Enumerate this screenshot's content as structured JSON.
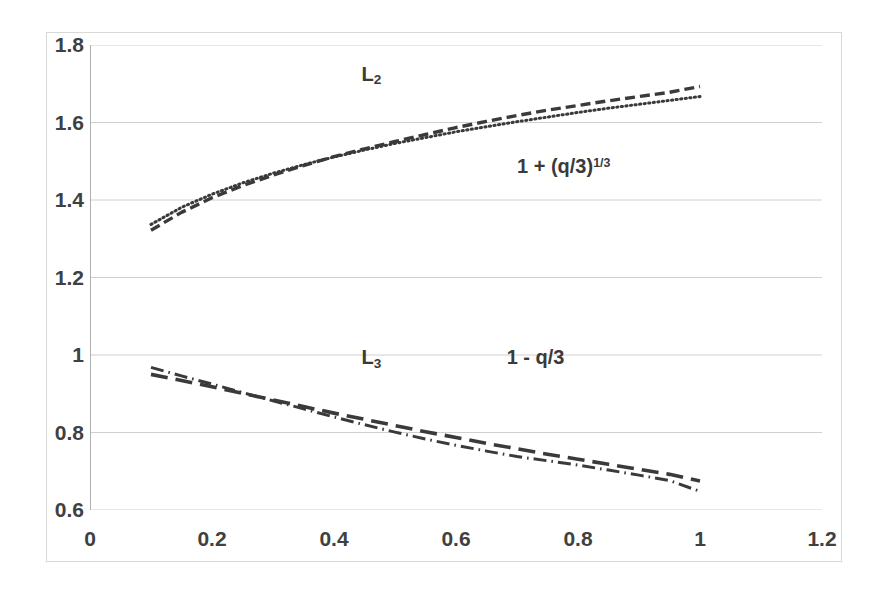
{
  "chart_data": {
    "type": "line",
    "title": "",
    "xlabel": "",
    "ylabel": "",
    "xlim": [
      0,
      1.2
    ],
    "ylim": [
      0.6,
      1.8
    ],
    "grid": true,
    "legend_position": "inline-annotations",
    "x_ticks": [
      "0",
      "0.2",
      "0.4",
      "0.6",
      "0.8",
      "1",
      "1.2"
    ],
    "x_tick_values": [
      0,
      0.2,
      0.4,
      0.6,
      0.8,
      1,
      1.2
    ],
    "y_ticks": [
      "0.6",
      "0.8",
      "1",
      "1.2",
      "1.4",
      "1.6",
      "1.8"
    ],
    "y_tick_values": [
      0.6,
      0.8,
      1,
      1.2,
      1.4,
      1.6,
      1.8
    ],
    "x": [
      0.1,
      0.15,
      0.2,
      0.25,
      0.3,
      0.35,
      0.4,
      0.45,
      0.5,
      0.55,
      0.6,
      0.65,
      0.7,
      0.75,
      0.8,
      0.85,
      0.9,
      0.95,
      1.0
    ],
    "series": [
      {
        "name": "L2",
        "label": "L₂",
        "style": "dotted",
        "color": "#3a3a3a",
        "values": [
          1.337,
          1.381,
          1.415,
          1.444,
          1.469,
          1.491,
          1.511,
          1.529,
          1.546,
          1.561,
          1.576,
          1.589,
          1.602,
          1.614,
          1.626,
          1.637,
          1.647,
          1.657,
          1.667
        ]
      },
      {
        "name": "1 + (q/3)^(1/3)",
        "label": "1 + (q/3)",
        "label_sup": "1/3",
        "style": "dashed",
        "color": "#3a3a3a",
        "values": [
          1.322,
          1.368,
          1.406,
          1.437,
          1.464,
          1.489,
          1.512,
          1.532,
          1.551,
          1.569,
          1.587,
          1.603,
          1.618,
          1.632,
          1.644,
          1.656,
          1.667,
          1.678,
          1.693
        ]
      },
      {
        "name": "L3",
        "label": "L₃",
        "style": "dash-dot",
        "color": "#3a3a3a",
        "values": [
          0.968,
          0.946,
          0.925,
          0.903,
          0.882,
          0.861,
          0.84,
          0.82,
          0.801,
          0.783,
          0.767,
          0.752,
          0.738,
          0.727,
          0.716,
          0.703,
          0.69,
          0.676,
          0.648
        ]
      },
      {
        "name": "1 - q/3",
        "label": "1 - q/3",
        "style": "long-dash",
        "color": "#3a3a3a",
        "values": [
          0.95,
          0.934,
          0.918,
          0.901,
          0.884,
          0.867,
          0.85,
          0.834,
          0.818,
          0.802,
          0.787,
          0.772,
          0.758,
          0.744,
          0.731,
          0.718,
          0.705,
          0.692,
          0.675
        ]
      }
    ],
    "annotations": [
      {
        "name": "L2-label",
        "text": "L₂",
        "x": 0.445,
        "y": 1.726
      },
      {
        "name": "upper-formula-label",
        "text": "1 + (q/3)",
        "superscript": "1/3",
        "x": 0.7,
        "y": 1.487
      },
      {
        "name": "L3-label",
        "text": "L₃",
        "x": 0.445,
        "y": 0.995
      },
      {
        "name": "lower-formula-label",
        "text": "1 - q/3",
        "x": 0.683,
        "y": 0.995
      }
    ]
  },
  "axes": {
    "y_labels": [
      {
        "text": "1.8",
        "value": 1.8
      },
      {
        "text": "1.6",
        "value": 1.6
      },
      {
        "text": "1.4",
        "value": 1.4
      },
      {
        "text": "1.2",
        "value": 1.2
      },
      {
        "text": "1",
        "value": 1.0
      },
      {
        "text": "0.8",
        "value": 0.8
      },
      {
        "text": "0.6",
        "value": 0.6
      }
    ],
    "x_labels": [
      {
        "text": "0",
        "value": 0
      },
      {
        "text": "0.2",
        "value": 0.2
      },
      {
        "text": "0.4",
        "value": 0.4
      },
      {
        "text": "0.6",
        "value": 0.6
      },
      {
        "text": "0.8",
        "value": 0.8
      },
      {
        "text": "1",
        "value": 1
      },
      {
        "text": "1.2",
        "value": 1.2
      }
    ]
  },
  "style": {
    "gridline_color": "#d0d0d0",
    "axis_color": "#b0b0b0",
    "frame_color": "#d8d8d8",
    "curve_color": "#3a3a3a",
    "tick_label_color": "#404040",
    "background": "#ffffff"
  }
}
